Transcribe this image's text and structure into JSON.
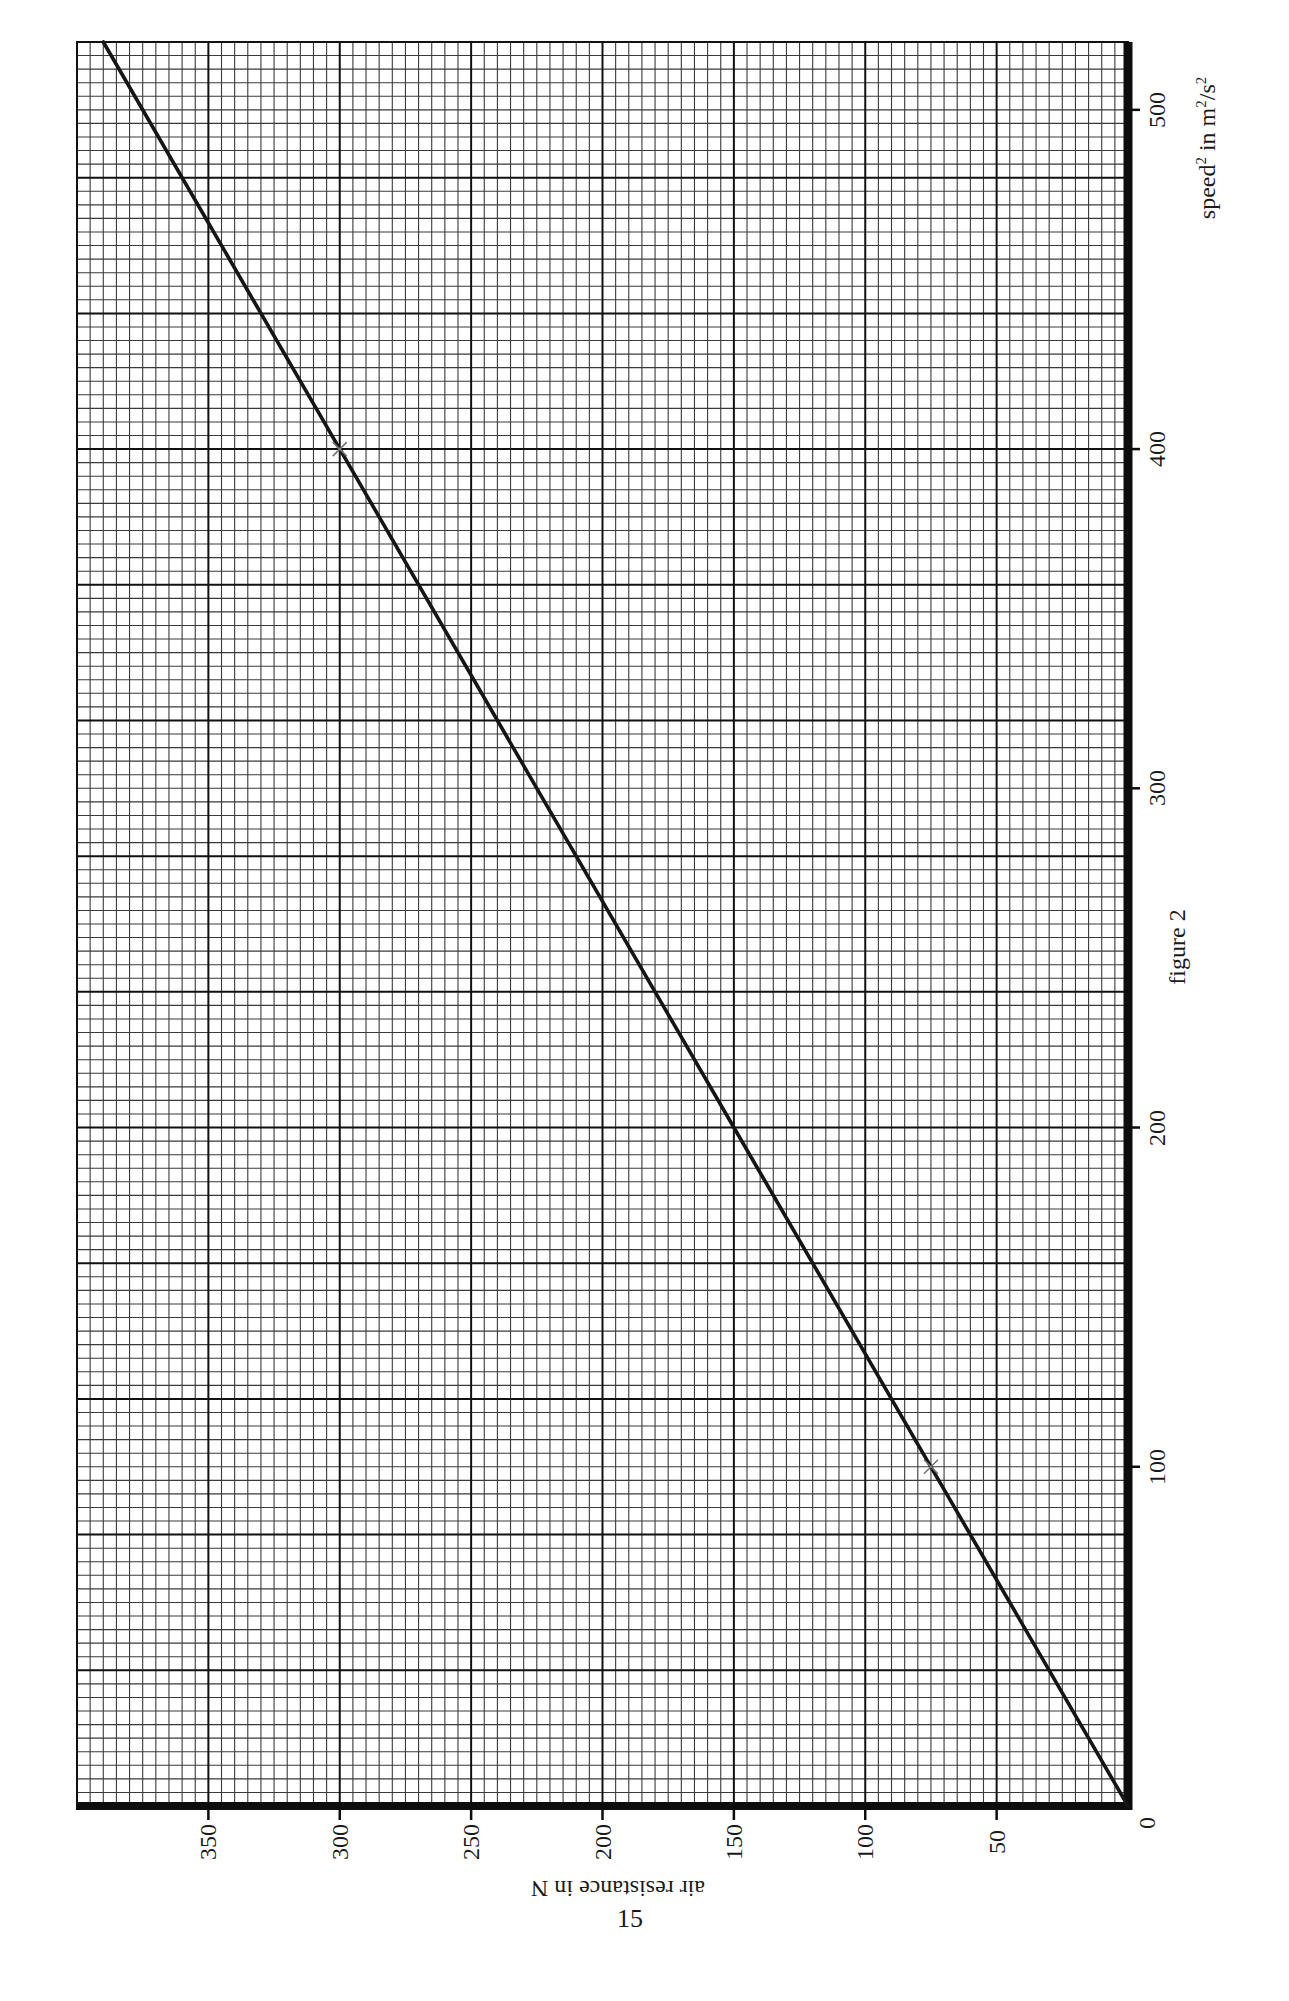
{
  "page": {
    "figure_caption": "figure 2",
    "page_number": "15"
  },
  "axes": {
    "x_title": {
      "base": "speed",
      "sup1": "2",
      "mid": " in m",
      "sup2": "2",
      "tail": "/s",
      "sup3": "2"
    },
    "y_title": "air resistance in N",
    "x_ticks": [
      "0",
      "100",
      "200",
      "300",
      "400",
      "500"
    ],
    "y_ticks": [
      "50",
      "100",
      "150",
      "200",
      "250",
      "300",
      "350"
    ]
  },
  "colors": {
    "paper": "#ffffff",
    "grid_minor": "#3a3a3a",
    "grid_major": "#111111",
    "axis": "#0d0d0d",
    "line": "#151515",
    "marker": "#777777"
  },
  "chart_data": {
    "type": "line",
    "title": "figure 2",
    "xlabel": "speed² in m²/s²",
    "ylabel": "air resistance in N",
    "orientation_note": "graph printed rotated 90° on graph paper: speed² runs bottom-to-top along the right edge, air resistance runs right-to-left along the bottom edge",
    "xlim": [
      0,
      520
    ],
    "ylim": [
      0,
      400
    ],
    "x_ticks": [
      0,
      100,
      200,
      300,
      400,
      500
    ],
    "y_ticks": [
      50,
      100,
      150,
      200,
      250,
      300,
      350
    ],
    "grid": {
      "minor_x_step": 4,
      "major_x_step": 40,
      "minor_y_step": 5,
      "major_y_step": 50
    },
    "series": [
      {
        "name": "best-fit line",
        "x": [
          0,
          100,
          200,
          300,
          400,
          520
        ],
        "y": [
          0,
          75,
          150,
          225,
          300,
          390
        ]
      }
    ],
    "points": [
      {
        "x": 100,
        "y": 75,
        "marker": "cross"
      },
      {
        "x": 400,
        "y": 300,
        "marker": "cross"
      }
    ],
    "legend": null
  }
}
